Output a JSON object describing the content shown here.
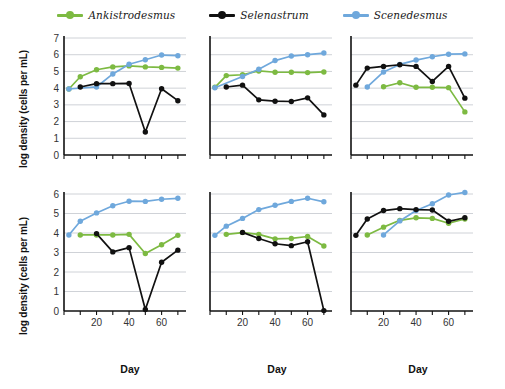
{
  "legend": {
    "position": "top-center",
    "items": [
      {
        "label": "Ankistrodesmus",
        "color": "#7dba42",
        "icon": "line-marker-green"
      },
      {
        "label": "Selenastrum",
        "color": "#111111",
        "icon": "line-marker-black"
      },
      {
        "label": "Scenedesmus",
        "color": "#6fa8dc",
        "icon": "line-marker-blue"
      }
    ]
  },
  "axis_titles": {
    "y": "log density (cells per mL)",
    "x": "Day"
  },
  "chart_data": {
    "type": "line",
    "title": "",
    "xlabel": "Day",
    "ylabel": "log density (cells per mL)",
    "grid": true,
    "legend_position": "top-center",
    "layout": {
      "rows": 2,
      "cols": 3
    },
    "xlim": [
      0,
      75
    ],
    "xticks": [
      0,
      10,
      20,
      30,
      40,
      50,
      60,
      70
    ],
    "xticklabels": [
      "",
      "",
      "20",
      "",
      "40",
      "",
      "60",
      ""
    ],
    "series_colors": {
      "Ankistrodesmus": "#7dba42",
      "Selenastrum": "#111111",
      "Scenedesmus": "#6fa8dc"
    },
    "panels": [
      {
        "row": 0,
        "col": 0,
        "ylim": [
          0,
          7
        ],
        "yticks": [
          0,
          1,
          2,
          3,
          4,
          5,
          6,
          7
        ],
        "show_yticklabels": true,
        "show_xticklabels": false,
        "series": [
          {
            "name": "Ankistrodesmus",
            "x": [
              3,
              10,
              20,
              30,
              40,
              50,
              60,
              70
            ],
            "y": [
              3.95,
              4.68,
              5.1,
              5.27,
              5.33,
              5.27,
              5.24,
              5.2
            ]
          },
          {
            "name": "Selenastrum",
            "x": [
              10,
              20,
              30,
              40,
              50,
              60,
              70
            ],
            "y": [
              4.07,
              4.27,
              4.27,
              4.28,
              1.38,
              3.96,
              3.25
            ]
          },
          {
            "name": "Scenedesmus",
            "x": [
              3,
              20,
              30,
              40,
              50,
              60,
              70
            ],
            "y": [
              3.95,
              4.07,
              4.85,
              5.43,
              5.7,
              5.98,
              5.94
            ]
          }
        ]
      },
      {
        "row": 0,
        "col": 1,
        "ylim": [
          0,
          7
        ],
        "yticks": [
          0,
          1,
          2,
          3,
          4,
          5,
          6,
          7
        ],
        "show_yticklabels": false,
        "show_xticklabels": false,
        "series": [
          {
            "name": "Ankistrodesmus",
            "x": [
              3,
              10,
              20,
              30,
              40,
              50,
              60,
              70
            ],
            "y": [
              4.05,
              4.75,
              4.8,
              5.03,
              4.95,
              4.95,
              4.93,
              4.97
            ]
          },
          {
            "name": "Selenastrum",
            "x": [
              10,
              20,
              30,
              40,
              50,
              60,
              70
            ],
            "y": [
              4.07,
              4.18,
              3.3,
              3.22,
              3.2,
              3.42,
              2.4
            ]
          },
          {
            "name": "Scenedesmus",
            "x": [
              3,
              20,
              30,
              40,
              50,
              60,
              70
            ],
            "y": [
              4.02,
              4.7,
              5.13,
              5.65,
              5.92,
              6.0,
              6.1
            ]
          }
        ]
      },
      {
        "row": 0,
        "col": 2,
        "ylim": [
          0,
          7
        ],
        "yticks": [
          0,
          1,
          2,
          3,
          4,
          5,
          6,
          7
        ],
        "show_yticklabels": false,
        "show_xticklabels": false,
        "series": [
          {
            "name": "Ankistrodesmus",
            "x": [
              20,
              30,
              40,
              50,
              60,
              70
            ],
            "y": [
              4.08,
              4.32,
              4.05,
              4.05,
              4.03,
              2.58
            ]
          },
          {
            "name": "Selenastrum",
            "x": [
              3,
              10,
              20,
              30,
              40,
              50,
              60,
              70
            ],
            "y": [
              4.18,
              5.2,
              5.3,
              5.4,
              5.3,
              4.4,
              5.3,
              3.4
            ]
          },
          {
            "name": "Scenedesmus",
            "x": [
              10,
              20,
              30,
              40,
              50,
              60,
              70
            ],
            "y": [
              4.07,
              4.97,
              5.42,
              5.68,
              5.88,
              6.03,
              6.05
            ]
          }
        ]
      },
      {
        "row": 1,
        "col": 0,
        "ylim": [
          0,
          6
        ],
        "yticks": [
          0,
          1,
          2,
          3,
          4,
          5,
          6
        ],
        "show_yticklabels": true,
        "show_xticklabels": true,
        "series": [
          {
            "name": "Ankistrodesmus",
            "x": [
              10,
              20,
              30,
              40,
              50,
              60,
              70
            ],
            "y": [
              3.9,
              3.9,
              3.9,
              3.93,
              2.95,
              3.4,
              3.88
            ]
          },
          {
            "name": "Selenastrum",
            "x": [
              20,
              30,
              40,
              50,
              60,
              70
            ],
            "y": [
              3.97,
              3.03,
              3.25,
              0.08,
              2.5,
              3.12
            ]
          },
          {
            "name": "Scenedesmus",
            "x": [
              3,
              10,
              20,
              30,
              40,
              50,
              60,
              70
            ],
            "y": [
              3.9,
              4.6,
              5.03,
              5.4,
              5.63,
              5.62,
              5.73,
              5.78
            ]
          }
        ]
      },
      {
        "row": 1,
        "col": 1,
        "ylim": [
          0,
          6
        ],
        "yticks": [
          0,
          1,
          2,
          3,
          4,
          5,
          6
        ],
        "show_yticklabels": false,
        "show_xticklabels": true,
        "series": [
          {
            "name": "Ankistrodesmus",
            "x": [
              10,
              20,
              30,
              40,
              50,
              60,
              70
            ],
            "y": [
              3.93,
              4.02,
              3.93,
              3.7,
              3.72,
              3.82,
              3.33
            ]
          },
          {
            "name": "Selenastrum",
            "x": [
              20,
              30,
              40,
              50,
              60,
              70
            ],
            "y": [
              4.03,
              3.72,
              3.45,
              3.35,
              3.55,
              0.02
            ]
          },
          {
            "name": "Scenedesmus",
            "x": [
              3,
              10,
              20,
              30,
              40,
              50,
              60,
              70
            ],
            "y": [
              3.88,
              4.35,
              4.75,
              5.2,
              5.42,
              5.62,
              5.78,
              5.6
            ]
          }
        ]
      },
      {
        "row": 1,
        "col": 2,
        "ylim": [
          0,
          6
        ],
        "yticks": [
          0,
          1,
          2,
          3,
          4,
          5,
          6
        ],
        "show_yticklabels": false,
        "show_xticklabels": true,
        "series": [
          {
            "name": "Ankistrodesmus",
            "x": [
              10,
              20,
              30,
              40,
              50,
              60,
              70
            ],
            "y": [
              3.9,
              4.3,
              4.65,
              4.78,
              4.75,
              4.5,
              4.72
            ]
          },
          {
            "name": "Selenastrum",
            "x": [
              3,
              10,
              20,
              30,
              40,
              50,
              60,
              70
            ],
            "y": [
              3.88,
              4.72,
              5.15,
              5.25,
              5.2,
              5.18,
              4.6,
              4.78
            ]
          },
          {
            "name": "Scenedesmus",
            "x": [
              20,
              30,
              40,
              50,
              60,
              70
            ],
            "y": [
              3.9,
              4.62,
              5.15,
              5.5,
              5.95,
              6.08
            ]
          }
        ]
      }
    ]
  }
}
